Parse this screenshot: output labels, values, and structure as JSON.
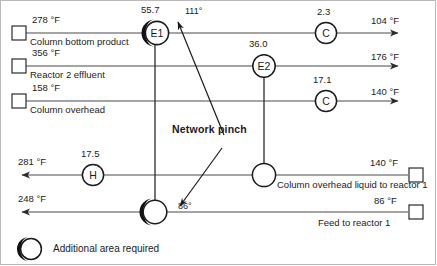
{
  "diagram": {
    "legend": {
      "symbol_name": "half-shaded-circle",
      "text": "Additional area required"
    },
    "pinch": {
      "label": "Network pinch",
      "upper_annotation": "111°",
      "lower_annotation": "86°"
    },
    "hot_streams": [
      {
        "id": "hot-1",
        "supply_temp": "278 °F",
        "name": "Column bottom product",
        "target_temp": "104 °F",
        "terminal_left": "open-square",
        "arrow": "right"
      },
      {
        "id": "hot-2",
        "supply_temp": "356 °F",
        "name": "Reactor 2 effluent",
        "target_temp": "176 °F",
        "terminal_left": "open-square",
        "arrow": "right"
      },
      {
        "id": "hot-3",
        "supply_temp": "158 °F",
        "name": "Column overhead",
        "target_temp": "140 °F",
        "terminal_left": "open-square",
        "arrow": "right"
      }
    ],
    "cold_streams": [
      {
        "id": "cold-1",
        "target_temp": "281 °F",
        "supply_temp": "140 °F",
        "name": "Column overhead liquid to reactor 1",
        "terminal_right": "open-square",
        "arrow": "left"
      },
      {
        "id": "cold-2",
        "target_temp": "248 °F",
        "supply_temp": "86 °F",
        "name": "Feed to reactor 1",
        "terminal_right": "open-square",
        "arrow": "left"
      }
    ],
    "units": [
      {
        "id": "E1",
        "label": "E1",
        "duty": "55.7",
        "type": "exchanger",
        "shaded": true
      },
      {
        "id": "E2",
        "label": "E2",
        "duty": "36.0",
        "type": "exchanger",
        "shaded": false
      },
      {
        "id": "C1",
        "label": "C",
        "duty": "2.3",
        "type": "cooler",
        "shaded": false
      },
      {
        "id": "C2",
        "label": "C",
        "duty": "17.1",
        "type": "cooler",
        "shaded": false
      },
      {
        "id": "H1",
        "label": "H",
        "duty": "17.5",
        "type": "heater",
        "shaded": false
      },
      {
        "id": "X1",
        "label": "",
        "duty": "",
        "type": "exchanger",
        "shaded": true
      },
      {
        "id": "X2",
        "label": "",
        "duty": "",
        "type": "exchanger",
        "shaded": false
      }
    ]
  }
}
